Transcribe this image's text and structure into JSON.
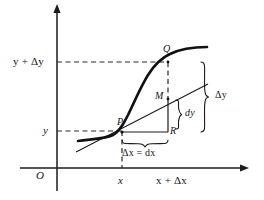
{
  "figure": {
    "background_color": "#ffffff",
    "ink_color": "#151515",
    "width": 264,
    "height": 200
  },
  "axes": {
    "origin_label": "O",
    "y_axis_name": "y-axis",
    "x_axis_name": "x-axis",
    "y_labels": [
      {
        "text": "y + Δy",
        "value": "y + Δy"
      },
      {
        "text": "y",
        "value": "y"
      }
    ],
    "x_labels": [
      {
        "text": "x",
        "value": "x"
      },
      {
        "text": "x + Δx",
        "value": "x + Δx"
      }
    ]
  },
  "points": [
    {
      "id": "P",
      "label": "P",
      "desc": "point-on-curve-at-x"
    },
    {
      "id": "Q",
      "label": "Q",
      "desc": "point-on-curve-at-x-plus-delta-x"
    },
    {
      "id": "M",
      "label": "M",
      "desc": "point-on-tangent-at-x-plus-delta-x"
    },
    {
      "id": "R",
      "label": "R",
      "desc": "corner-of-right-triangle"
    }
  ],
  "annotations": {
    "delta_y": "Δy",
    "dy": "dy",
    "delta_x_eq_dx": "Δx = dx"
  },
  "curves": {
    "function_curve": "y = f(x)",
    "tangent_line": "tangent at P"
  }
}
